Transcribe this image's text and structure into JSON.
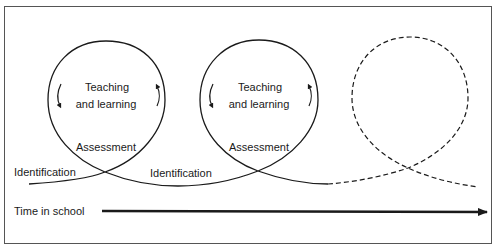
{
  "diagram": {
    "type": "cyclical-process-timeline",
    "loops": [
      {
        "center_label_line1": "Teaching",
        "center_label_line2": "and learning",
        "bottom_label": "Assessment",
        "style": "solid"
      },
      {
        "center_label_line1": "Teaching",
        "center_label_line2": "and learning",
        "bottom_label": "Assessment",
        "style": "solid"
      },
      {
        "style": "dashed"
      }
    ],
    "entry_labels": [
      "Identification",
      "Identification"
    ],
    "timeline_label": "Time in school",
    "colors": {
      "line": "#1a1a1a",
      "frame": "#555555",
      "background": "#ffffff"
    }
  }
}
